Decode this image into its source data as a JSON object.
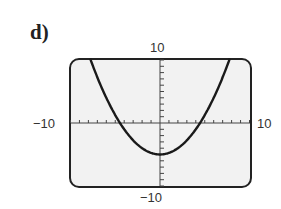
{
  "part_label": "d)",
  "chart_data": {
    "type": "line",
    "title": "",
    "function": "y = 0.25x^2 - 5",
    "xlim": [
      -10,
      10
    ],
    "ylim": [
      -10,
      10
    ],
    "xlabel": "",
    "ylabel": "",
    "tick_labels": {
      "x_min": "−10",
      "x_max": "10",
      "y_min": "−10",
      "y_max": "10"
    },
    "x_tick_step": 1,
    "y_tick_step": 1,
    "grid": false,
    "series": [
      {
        "name": "parabola",
        "x": [
          -8,
          -6,
          -4,
          -2,
          0,
          2,
          4,
          6,
          8
        ],
        "y": [
          11,
          4,
          -1,
          -4,
          -5,
          -4,
          -1,
          4,
          11
        ]
      }
    ],
    "vertex": [
      0,
      -5
    ],
    "x_intercepts": [
      -4.47,
      4.47
    ]
  }
}
